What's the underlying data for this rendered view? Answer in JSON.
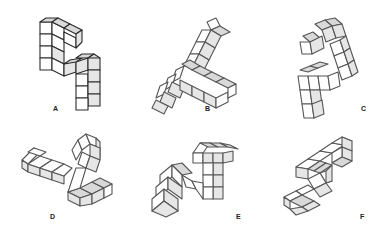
{
  "puzzle": {
    "type": "mental-rotation",
    "reference_figure": "A",
    "options": [
      {
        "id": "A",
        "label": "A",
        "role": "reference"
      },
      {
        "id": "B",
        "label": "B",
        "role": "option"
      },
      {
        "id": "C",
        "label": "C",
        "role": "option"
      },
      {
        "id": "D",
        "label": "D",
        "role": "option"
      },
      {
        "id": "E",
        "label": "E",
        "role": "option"
      },
      {
        "id": "F",
        "label": "F",
        "role": "option"
      }
    ]
  },
  "colors": {
    "background": "#ffffff",
    "cube_top": "#d9d9d9",
    "cube_front": "#ffffff",
    "cube_side": "#e6e6e6",
    "edge_reference": "#2a2a2a",
    "edge_options": "#555555"
  }
}
